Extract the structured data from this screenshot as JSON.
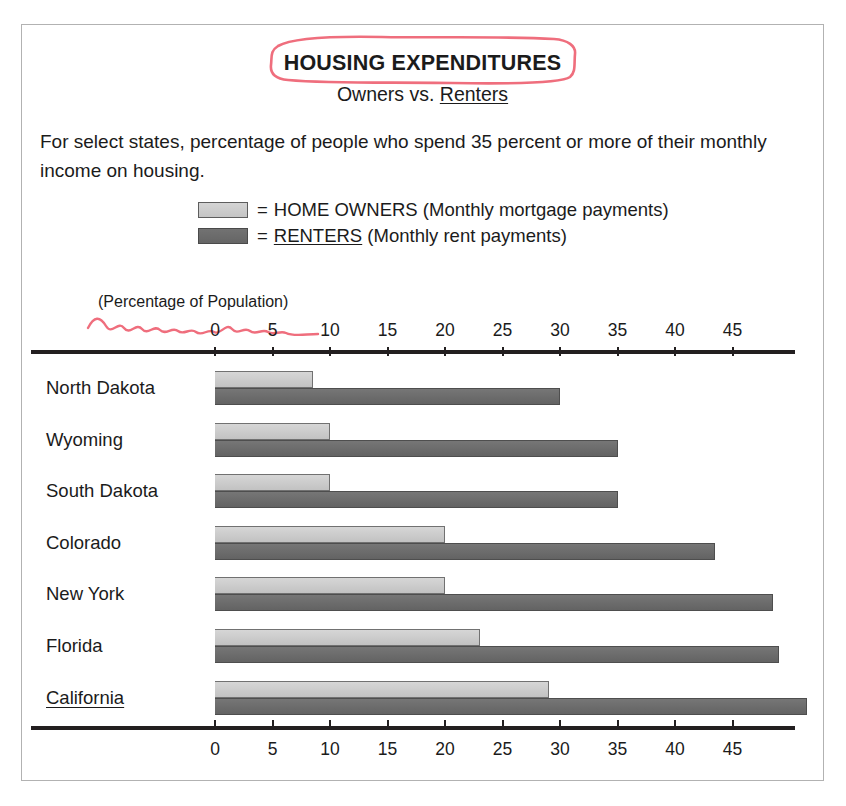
{
  "card": {
    "main_title": "HOUSING EXPENDITURES",
    "subtitle_prefix": "Owners vs. ",
    "subtitle_underlined": "Renters",
    "description": "For select states, percentage of people who spend 35 percent or more of their monthly income on housing.",
    "axis_caption": "(Percentage of Population)"
  },
  "legend": [
    {
      "swatch": "owners",
      "equals": "=",
      "name": "HOME OWNERS",
      "detail": "(Monthly mortgage payments)",
      "underline": false,
      "color": "#c8c8c8"
    },
    {
      "swatch": "renters",
      "equals": "=",
      "name": "RENTERS",
      "detail": "(Monthly rent payments)",
      "underline": true,
      "color": "#6a6a6a"
    }
  ],
  "annotations": {
    "scribble_color": "#ef6e7d",
    "title_circled": "HOUSING EXPENDITURES",
    "caption_squiggle_under": "(Percentage of Population)"
  },
  "chart_data": {
    "type": "bar",
    "orientation": "horizontal",
    "title": "HOUSING EXPENDITURES",
    "subtitle": "Owners vs. Renters",
    "xlabel": "(Percentage of Population)",
    "ylabel": "",
    "xlim": [
      0,
      50
    ],
    "xticks": [
      0,
      5,
      10,
      15,
      20,
      25,
      30,
      35,
      40,
      45
    ],
    "grid": false,
    "legend_position": "top-center",
    "categories": [
      "North Dakota",
      "Wyoming",
      "South Dakota",
      "Colorado",
      "New York",
      "Florida",
      "California"
    ],
    "series": [
      {
        "name": "HOME OWNERS",
        "color": "#c8c8c8",
        "values": [
          8.5,
          10,
          10,
          20,
          20,
          23,
          29
        ]
      },
      {
        "name": "RENTERS",
        "color": "#6a6a6a",
        "values": [
          30,
          35,
          35,
          43.5,
          48.5,
          49,
          51.5
        ]
      }
    ]
  }
}
